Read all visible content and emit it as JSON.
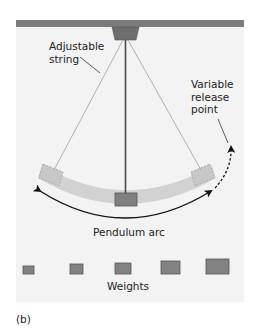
{
  "figure": {
    "panel_label": "(b)",
    "labels": {
      "adjustable_string_line1": "Adjustable",
      "adjustable_string_line2": "string",
      "variable_release_line1": "Variable",
      "variable_release_line2": "release",
      "variable_release_line3": "point",
      "pendulum_arc": "Pendulum arc",
      "weights": "Weights"
    },
    "weights": [
      {
        "id": 1,
        "width": 11,
        "height": 8
      },
      {
        "id": 2,
        "width": 13,
        "height": 9
      },
      {
        "id": 3,
        "width": 16,
        "height": 11
      },
      {
        "id": 4,
        "width": 19,
        "height": 12
      },
      {
        "id": 5,
        "width": 23,
        "height": 14
      }
    ],
    "colors": {
      "background": "#f3f3f3",
      "bar": "#7b7b7b",
      "mount": "#6e6e6e",
      "rod": "#4a4a4a",
      "string": "#a8a8a8",
      "arc_band": "#cfcfcf",
      "bob": "#808080",
      "weight": "#828282",
      "arrow": "#111111"
    }
  }
}
